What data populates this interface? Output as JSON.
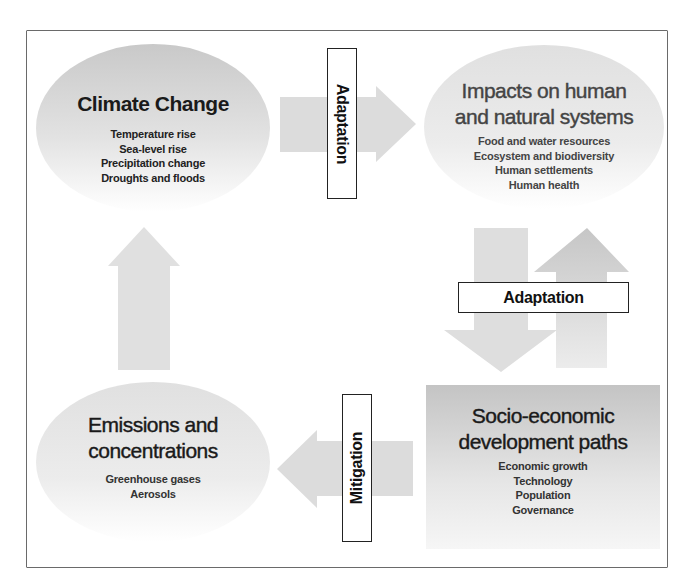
{
  "diagram": {
    "nodes": {
      "climate_change": {
        "title": "Climate Change",
        "items": [
          "Temperature rise",
          "Sea-level rise",
          "Precipitation change",
          "Droughts and floods"
        ]
      },
      "impacts": {
        "title_lines": [
          "Impacts on human",
          "and natural systems"
        ],
        "items": [
          "Food and water resources",
          "Ecosystem and biodiversity",
          "Human settlements",
          "Human health"
        ]
      },
      "socio_economic": {
        "title_lines": [
          "Socio-economic",
          "development paths"
        ],
        "items": [
          "Economic growth",
          "Technology",
          "Population",
          "Governance"
        ]
      },
      "emissions": {
        "title_lines": [
          "Emissions and",
          "concentrations"
        ],
        "items": [
          "Greenhouse gases",
          "Aerosols"
        ]
      }
    },
    "labels": {
      "top_arrow": "Adaptation",
      "right_arrows": "Adaptation",
      "bottom_arrow": "Mitigation"
    },
    "colors": {
      "shape_gray_dark": "#c4c4c4",
      "shape_gray_light": "#f4f4f4",
      "arrow_gray": "#dcdcdc",
      "frame": "#6a6a6a",
      "text": "#1a1a1a"
    }
  }
}
